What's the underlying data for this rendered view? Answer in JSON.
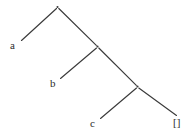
{
  "diagram": {
    "type": "binary-tree",
    "background_color": "#ffffff",
    "line_color": "#3a3a3a",
    "text_color": "#2b2b2b",
    "nodes": [
      {
        "id": "n1",
        "kind": "branch",
        "label": "",
        "x": 57.5,
        "y": 7
      },
      {
        "id": "n2",
        "kind": "branch",
        "label": "",
        "x": 97.5,
        "y": 46.5
      },
      {
        "id": "n3",
        "kind": "branch",
        "label": "",
        "x": 137.5,
        "y": 86.5
      }
    ],
    "leaves": [
      {
        "id": "l1",
        "label": "a",
        "x": 10,
        "y": 40
      },
      {
        "id": "l2",
        "label": "b",
        "x": 50,
        "y": 78
      },
      {
        "id": "l3",
        "label": "c",
        "x": 90,
        "y": 118
      },
      {
        "id": "l4",
        "label": "[]",
        "x": 173,
        "y": 117
      }
    ],
    "edges": [
      {
        "id": "e1",
        "from": "n1",
        "to": "l1",
        "x1": 56.5,
        "y1": 8.5,
        "x2": 21.5,
        "y2": 40.5
      },
      {
        "id": "e2",
        "from": "n1",
        "to": "n2",
        "x1": 58.8,
        "y1": 8.5,
        "x2": 96.3,
        "y2": 45.3
      },
      {
        "id": "e3",
        "from": "n2",
        "to": "l2",
        "x1": 96.5,
        "y1": 48.0,
        "x2": 60.5,
        "y2": 78.5
      },
      {
        "id": "e4",
        "from": "n2",
        "to": "n3",
        "x1": 98.8,
        "y1": 48.0,
        "x2": 136.3,
        "y2": 85.3
      },
      {
        "id": "e5",
        "from": "n3",
        "to": "l3",
        "x1": 136.5,
        "y1": 88.0,
        "x2": 100.5,
        "y2": 118.5
      },
      {
        "id": "e6",
        "from": "n3",
        "to": "l4",
        "x1": 138.8,
        "y1": 88.0,
        "x2": 176.5,
        "y2": 115.5
      }
    ]
  }
}
